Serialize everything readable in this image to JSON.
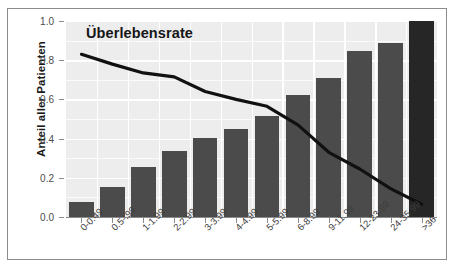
{
  "chart_data": {
    "type": "bar",
    "title": "Überlebensrate",
    "xlabel": "",
    "ylabel": "Anteil aller Patienten",
    "ylim": [
      0.0,
      1.0
    ],
    "grid": true,
    "legend_position": "none",
    "categories": [
      "0-0.49",
      "0.5-.99",
      "1-1.99",
      "2-2.99",
      "3-3.99",
      "4-4.99",
      "5-5.99",
      "6-8.99",
      "9-11.99",
      "12-23.99",
      "24-35.99",
      ">36"
    ],
    "y_ticks": [
      "0.0",
      "0.2",
      "0.4",
      "0.6",
      "0.8",
      "1.0"
    ],
    "y_tick_values": [
      0.0,
      0.2,
      0.4,
      0.6,
      0.8,
      1.0
    ],
    "series": [
      {
        "name": "Anteil aller Patienten",
        "type": "bar",
        "values": [
          0.075,
          0.155,
          0.255,
          0.335,
          0.405,
          0.45,
          0.515,
          0.625,
          0.71,
          0.845,
          0.89,
          1.0
        ]
      },
      {
        "name": "Überlebensrate",
        "type": "line",
        "values": [
          0.83,
          0.78,
          0.735,
          0.715,
          0.64,
          0.6,
          0.565,
          0.47,
          0.33,
          0.245,
          0.145,
          0.065
        ]
      }
    ],
    "annotations": [
      {
        "text": "Überlebensrate",
        "target": "line-series"
      }
    ],
    "colors": {
      "bar": "#4b4b4b",
      "bar_last": "#262626",
      "line": "#111111",
      "plot_background": "#ededed",
      "gridline": "#ffffff",
      "figure_border": "#8c8c8c",
      "axis": "#8a8a8a",
      "text": "#1a1a1a"
    }
  }
}
